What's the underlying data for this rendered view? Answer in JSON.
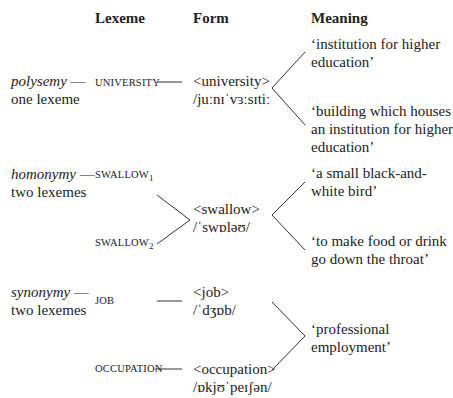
{
  "headers": {
    "lexeme": "Lexeme",
    "form": "Form",
    "meaning": "Meaning"
  },
  "rows": [
    {
      "relation": "polysemy",
      "relation_note": "one lexeme",
      "lexemes": [
        {
          "name": "UNIVERSITY",
          "subscript": ""
        }
      ],
      "forms": [
        {
          "orthographic": "<university>",
          "phonetic": "/juːnɪˈvɜːsɪtiː"
        }
      ],
      "meanings": [
        {
          "line1": "‘institution for higher",
          "line2": "education’"
        },
        {
          "line1": "‘building which houses",
          "line2": "an institution for higher",
          "line3": "education’"
        }
      ]
    },
    {
      "relation": "homonymy",
      "relation_note": "two lexemes",
      "lexemes": [
        {
          "name": "SWALLOW",
          "subscript": "1"
        },
        {
          "name": "SWALLOW",
          "subscript": "2"
        }
      ],
      "forms": [
        {
          "orthographic": "<swallow>",
          "phonetic": "/ˈswɒləʊ/"
        }
      ],
      "meanings": [
        {
          "line1": "‘a small black-and-",
          "line2": "white bird’"
        },
        {
          "line1": "‘to make food or drink",
          "line2": "go down the throat’"
        }
      ]
    },
    {
      "relation": "synonymy",
      "relation_note": "two lexemes",
      "lexemes": [
        {
          "name": "JOB",
          "subscript": ""
        },
        {
          "name": "OCCUPATION",
          "subscript": ""
        }
      ],
      "forms": [
        {
          "orthographic": "<job>",
          "phonetic": "/ˈdʒɒb/"
        },
        {
          "orthographic": "<occupation>",
          "phonetic": "/ɒkjʊˈpeɪʃən/"
        }
      ],
      "meanings": [
        {
          "line1": "‘professional",
          "line2": "employment’"
        }
      ]
    }
  ],
  "dash": " —"
}
